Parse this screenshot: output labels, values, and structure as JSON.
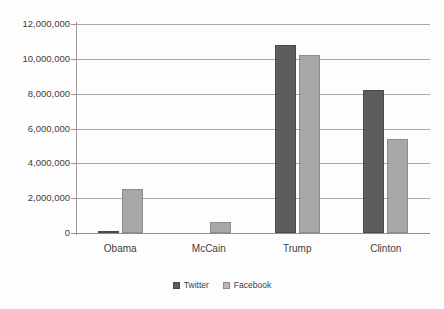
{
  "chart_data": {
    "type": "bar",
    "title": "",
    "subtitle": "",
    "xlabel": "",
    "ylabel": "",
    "categories": [
      "Obama",
      "McCain",
      "Trump",
      "Clinton"
    ],
    "series": [
      {
        "name": "Twitter",
        "color": "#5d5d5d",
        "values": [
          100000,
          0,
          10800000,
          8200000
        ]
      },
      {
        "name": "Facebook",
        "color": "#a8a8a8",
        "values": [
          2500000,
          650000,
          10200000,
          5400000
        ]
      }
    ],
    "ylim": [
      0,
      12000000
    ],
    "ytick_values": [
      0,
      2000000,
      4000000,
      6000000,
      8000000,
      10000000,
      12000000
    ],
    "ytick_labels": [
      "0",
      "2,000,000",
      "4,000,000",
      "6,000,000",
      "8,000,000",
      "10,000,000",
      "12,000,000"
    ],
    "grid": true,
    "legend_position": "bottom",
    "legend_entries": [
      "Twitter",
      "Facebook"
    ]
  }
}
